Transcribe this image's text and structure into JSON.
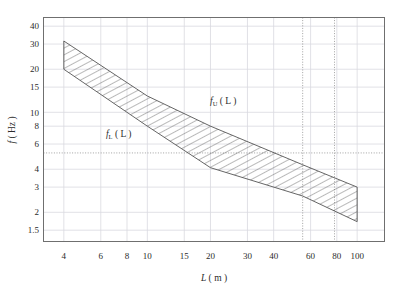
{
  "chart_data": {
    "type": "area",
    "title": "",
    "xlabel": "L ( m )",
    "ylabel": "f ( Hz )",
    "xscale": "log",
    "yscale": "log",
    "xlim": [
      3.2,
      135
    ],
    "ylim": [
      1.25,
      46
    ],
    "grid": true,
    "legend": "none",
    "xticks": [
      4,
      6,
      8,
      10,
      15,
      20,
      30,
      40,
      60,
      80,
      100
    ],
    "xtick_labels": [
      "4",
      "6",
      "8",
      "10",
      "15",
      "20",
      "30",
      "40",
      "60",
      "80",
      "100"
    ],
    "yticks": [
      1.5,
      2,
      3,
      4,
      6,
      8,
      10,
      15,
      20,
      30,
      40
    ],
    "ytick_labels": [
      "1.5",
      "2",
      "3",
      "4",
      "6",
      "8",
      "10",
      "15",
      "20",
      "30",
      "40"
    ],
    "series": [
      {
        "name": "f_U ( L )",
        "role": "upper-bound",
        "x": [
          4,
          10,
          20,
          55,
          100
        ],
        "values": [
          31.5,
          13.0,
          8.0,
          4.3,
          3.0
        ]
      },
      {
        "name": "f_L ( L )",
        "role": "lower-bound",
        "x": [
          4,
          10,
          20,
          55,
          100
        ],
        "values": [
          20.0,
          8.0,
          4.1,
          2.6,
          1.72
        ]
      }
    ],
    "band": {
      "fill": "hatched",
      "hatch_angle_deg": 62,
      "edge_color": "#555555"
    },
    "annotations": [
      {
        "text": "f_U ( L )",
        "symbol": "f",
        "subscript": "U",
        "arg": "( L )",
        "x": 23,
        "y": 11.5
      },
      {
        "text": "f_L ( L )",
        "symbol": "f",
        "subscript": "L",
        "arg": "( L )",
        "x": 7.3,
        "y": 6.7
      }
    ],
    "reference_lines": [
      {
        "orientation": "horizontal",
        "value": 5.2,
        "style": "dotted"
      },
      {
        "orientation": "vertical",
        "value": 55,
        "style": "dotted"
      },
      {
        "orientation": "vertical",
        "value": 78,
        "style": "dotted"
      }
    ],
    "colors": {
      "frame": "#6f6f6f",
      "grid": "#d9d9e0",
      "reference": "#8a8a8a",
      "curve": "#555555",
      "text": "#2b2b2b",
      "background": "#ffffff"
    }
  }
}
